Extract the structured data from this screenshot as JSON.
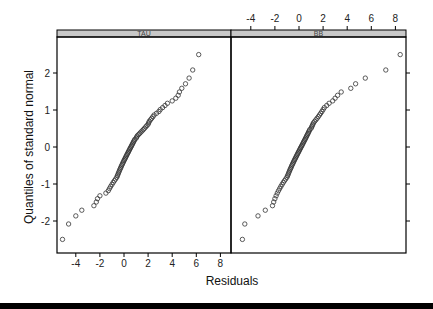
{
  "chart_data": {
    "type": "scatter",
    "subtype": "normal-qq-trellis",
    "xlabel": "Residuals",
    "ylabel": "Quantiles of standard normal",
    "xlim": [
      -5.5,
      9
    ],
    "ylim": [
      -3,
      2.9
    ],
    "x_ticks": [
      -4,
      -2,
      0,
      2,
      4,
      6,
      8
    ],
    "y_ticks": [
      -2,
      -1,
      0,
      1,
      2
    ],
    "grid": false,
    "legend": null,
    "panels": [
      {
        "name": "TAU",
        "x_axis_position": "bottom",
        "n": 80,
        "residuals": [
          -5.1,
          -4.6,
          -4.0,
          -3.5,
          -2.5,
          -2.3,
          -2.2,
          -2.0,
          -1.5,
          -1.3,
          -1.2,
          -1.1,
          -1.0,
          -0.9,
          -0.8,
          -0.7,
          -0.6,
          -0.55,
          -0.5,
          -0.45,
          -0.4,
          -0.35,
          -0.3,
          -0.25,
          -0.2,
          -0.15,
          -0.1,
          -0.05,
          0.0,
          0.05,
          0.1,
          0.15,
          0.2,
          0.25,
          0.3,
          0.35,
          0.4,
          0.45,
          0.5,
          0.55,
          0.6,
          0.65,
          0.7,
          0.75,
          0.8,
          0.85,
          0.9,
          1.0,
          1.05,
          1.1,
          1.2,
          1.3,
          1.4,
          1.5,
          1.6,
          1.7,
          1.8,
          1.9,
          2.0,
          2.05,
          2.1,
          2.2,
          2.3,
          2.4,
          2.5,
          2.7,
          2.9,
          3.0,
          3.2,
          3.4,
          3.6,
          4.0,
          4.3,
          4.5,
          4.6,
          4.8,
          5.1,
          5.4,
          5.7,
          6.2
        ]
      },
      {
        "name": "BB",
        "x_axis_position": "top",
        "n": 80,
        "residuals": [
          -4.7,
          -4.5,
          -3.4,
          -2.8,
          -2.2,
          -2.1,
          -2.0,
          -1.9,
          -1.8,
          -1.7,
          -1.6,
          -1.5,
          -1.4,
          -1.3,
          -1.2,
          -1.1,
          -1.0,
          -0.95,
          -0.9,
          -0.85,
          -0.8,
          -0.75,
          -0.7,
          -0.65,
          -0.6,
          -0.55,
          -0.5,
          -0.45,
          -0.4,
          -0.35,
          -0.3,
          -0.25,
          -0.2,
          -0.15,
          -0.1,
          -0.05,
          0.0,
          0.05,
          0.1,
          0.15,
          0.2,
          0.25,
          0.3,
          0.35,
          0.4,
          0.45,
          0.5,
          0.55,
          0.6,
          0.65,
          0.7,
          0.75,
          0.8,
          0.85,
          0.9,
          1.0,
          1.05,
          1.1,
          1.15,
          1.2,
          1.3,
          1.4,
          1.5,
          1.6,
          1.7,
          1.8,
          1.9,
          2.0,
          2.1,
          2.3,
          2.5,
          2.8,
          3.0,
          3.2,
          3.5,
          4.3,
          4.7,
          5.5,
          7.2,
          8.4
        ]
      }
    ]
  },
  "colors": {
    "strip_bg": "#c8c8c8",
    "point_stroke": "#333333",
    "axis": "#000000"
  }
}
